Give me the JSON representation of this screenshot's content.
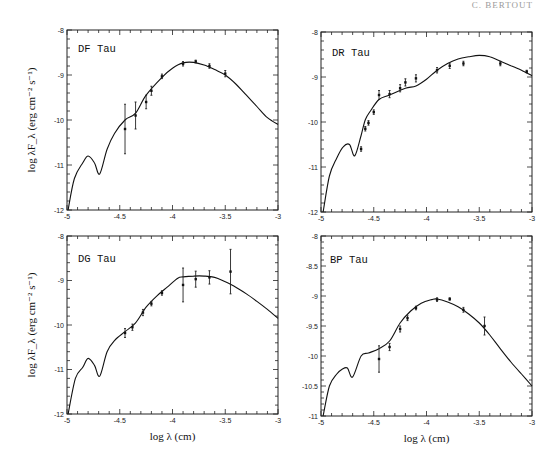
{
  "header": {
    "text": "C. BERTOUT"
  },
  "axis_labels": {
    "y": "log λF_λ (erg cm⁻² s⁻¹)",
    "x": "log λ  (cm)"
  },
  "chart_data": [
    {
      "type": "line",
      "title": "DF Tau",
      "xlabel": "",
      "ylabel": "log λF_λ (erg cm⁻² s⁻¹)",
      "xlim": [
        -5,
        -3
      ],
      "ylim": [
        -12,
        -8
      ],
      "xticks": [
        "-5",
        "-4.5",
        "-4",
        "-3.5",
        "-3"
      ],
      "yticks": [
        "-12",
        "-11",
        "-10",
        "-9",
        "-8"
      ],
      "model_curve": {
        "x": [
          -4.99,
          -4.93,
          -4.85,
          -4.8,
          -4.74,
          -4.69,
          -4.62,
          -4.55,
          -4.45,
          -4.35,
          -4.25,
          -4.1,
          -4.0,
          -3.9,
          -3.8,
          -3.7,
          -3.6,
          -3.5,
          -3.4,
          -3.3,
          -3.2,
          -3.1,
          -3.0
        ],
        "y": [
          -12.0,
          -11.3,
          -10.95,
          -10.8,
          -10.95,
          -11.2,
          -10.65,
          -10.3,
          -10.0,
          -9.85,
          -9.45,
          -9.05,
          -8.85,
          -8.73,
          -8.72,
          -8.78,
          -8.88,
          -9.0,
          -9.2,
          -9.45,
          -9.7,
          -9.95,
          -10.1
        ]
      },
      "observations": [
        {
          "x": -4.45,
          "y": -10.2,
          "err": 0.55
        },
        {
          "x": -4.35,
          "y": -9.9,
          "err": 0.3
        },
        {
          "x": -4.25,
          "y": -9.6,
          "err": 0.15
        },
        {
          "x": -4.2,
          "y": -9.35,
          "err": 0.1
        },
        {
          "x": -4.1,
          "y": -9.03,
          "err": 0.05
        },
        {
          "x": -3.9,
          "y": -8.75,
          "err": 0.05
        },
        {
          "x": -3.78,
          "y": -8.7,
          "err": 0.03
        },
        {
          "x": -3.65,
          "y": -8.8,
          "err": 0.05
        },
        {
          "x": -3.5,
          "y": -8.97,
          "err": 0.07
        }
      ]
    },
    {
      "type": "line",
      "title": "DR Tau",
      "xlabel": "",
      "ylabel": "",
      "xlim": [
        -5,
        -3
      ],
      "ylim": [
        -12,
        -8
      ],
      "xticks": [
        "-5",
        "-4.5",
        "-4",
        "-3.5",
        "-3"
      ],
      "yticks": [
        "-12",
        "-11",
        "-10",
        "-9",
        "-8"
      ],
      "model_curve": {
        "x": [
          -4.98,
          -4.92,
          -4.85,
          -4.79,
          -4.73,
          -4.68,
          -4.62,
          -4.58,
          -4.53,
          -4.45,
          -4.35,
          -4.2,
          -4.1,
          -4.0,
          -3.9,
          -3.8,
          -3.7,
          -3.6,
          -3.5,
          -3.4,
          -3.3,
          -3.2,
          -3.1,
          -3.0
        ],
        "y": [
          -12.0,
          -11.2,
          -10.8,
          -10.55,
          -10.5,
          -10.75,
          -10.3,
          -9.95,
          -9.75,
          -9.5,
          -9.4,
          -9.25,
          -9.2,
          -9.05,
          -8.85,
          -8.7,
          -8.6,
          -8.55,
          -8.52,
          -8.55,
          -8.65,
          -8.75,
          -8.85,
          -8.97
        ]
      },
      "observations": [
        {
          "x": -4.62,
          "y": -10.6,
          "err": 0.05
        },
        {
          "x": -4.58,
          "y": -10.15,
          "err": 0.05
        },
        {
          "x": -4.55,
          "y": -10.02,
          "err": 0.05
        },
        {
          "x": -4.5,
          "y": -9.78,
          "err": 0.05
        },
        {
          "x": -4.45,
          "y": -9.4,
          "err": 0.1
        },
        {
          "x": -4.35,
          "y": -9.38,
          "err": 0.08
        },
        {
          "x": -4.25,
          "y": -9.25,
          "err": 0.08
        },
        {
          "x": -4.2,
          "y": -9.12,
          "err": 0.08
        },
        {
          "x": -4.1,
          "y": -9.03,
          "err": 0.08
        },
        {
          "x": -3.9,
          "y": -8.85,
          "err": 0.06
        },
        {
          "x": -3.78,
          "y": -8.75,
          "err": 0.06
        },
        {
          "x": -3.65,
          "y": -8.7,
          "err": 0.05
        },
        {
          "x": -3.3,
          "y": -8.7,
          "err": 0.05
        },
        {
          "x": -3.05,
          "y": -8.88,
          "err": 0.03
        }
      ]
    },
    {
      "type": "line",
      "title": "DG Tau",
      "xlabel": "log λ  (cm)",
      "ylabel": "log λF_λ (erg cm⁻² s⁻¹)",
      "xlim": [
        -5,
        -3
      ],
      "ylim": [
        -12,
        -8
      ],
      "xticks": [
        "-5",
        "-4.5",
        "-4",
        "-3.5",
        "-3"
      ],
      "yticks": [
        "-12",
        "-11",
        "-10",
        "-9",
        "-8"
      ],
      "model_curve": {
        "x": [
          -4.99,
          -4.92,
          -4.85,
          -4.8,
          -4.74,
          -4.69,
          -4.62,
          -4.55,
          -4.45,
          -4.35,
          -4.25,
          -4.15,
          -4.05,
          -3.95,
          -3.9,
          -3.8,
          -3.7,
          -3.6,
          -3.5,
          -3.4,
          -3.3,
          -3.2,
          -3.1,
          -3.0
        ],
        "y": [
          -12.0,
          -11.2,
          -10.95,
          -10.75,
          -10.9,
          -11.15,
          -10.6,
          -10.35,
          -10.15,
          -9.95,
          -9.6,
          -9.35,
          -9.15,
          -8.95,
          -8.92,
          -8.9,
          -8.9,
          -8.93,
          -9.03,
          -9.15,
          -9.3,
          -9.47,
          -9.65,
          -9.85
        ]
      },
      "observations": [
        {
          "x": -4.45,
          "y": -10.18,
          "err": 0.1
        },
        {
          "x": -4.38,
          "y": -10.05,
          "err": 0.07
        },
        {
          "x": -4.28,
          "y": -9.72,
          "err": 0.07
        },
        {
          "x": -4.2,
          "y": -9.52,
          "err": 0.05
        },
        {
          "x": -4.1,
          "y": -9.28,
          "err": 0.05
        },
        {
          "x": -3.9,
          "y": -9.1,
          "err": 0.38
        },
        {
          "x": -3.78,
          "y": -8.97,
          "err": 0.18
        },
        {
          "x": -3.65,
          "y": -8.93,
          "err": 0.15
        },
        {
          "x": -3.45,
          "y": -8.8,
          "err": 0.5
        }
      ]
    },
    {
      "type": "line",
      "title": "BP Tau",
      "xlabel": "log λ  (cm)",
      "ylabel": "",
      "xlim": [
        -5,
        -3
      ],
      "ylim": [
        -11,
        -8
      ],
      "xticks": [
        "-5",
        "-4.5",
        "-4",
        "-3.5",
        "-3"
      ],
      "yticks": [
        "-11",
        "-10.5",
        "-10",
        "-9.5",
        "-9",
        "-8.5",
        "-8"
      ],
      "model_curve": {
        "x": [
          -4.98,
          -4.92,
          -4.85,
          -4.8,
          -4.75,
          -4.7,
          -4.62,
          -4.55,
          -4.45,
          -4.35,
          -4.25,
          -4.15,
          -4.05,
          -3.95,
          -3.9,
          -3.8,
          -3.7,
          -3.6,
          -3.5,
          -3.4,
          -3.3,
          -3.2,
          -3.1,
          -3.0
        ],
        "y": [
          -11.0,
          -10.5,
          -10.3,
          -10.22,
          -10.2,
          -10.35,
          -10.0,
          -9.95,
          -9.88,
          -9.75,
          -9.45,
          -9.25,
          -9.12,
          -9.06,
          -9.05,
          -9.1,
          -9.18,
          -9.3,
          -9.45,
          -9.65,
          -9.88,
          -10.1,
          -10.3,
          -10.5
        ]
      },
      "observations": [
        {
          "x": -4.45,
          "y": -10.05,
          "err": 0.22
        },
        {
          "x": -4.35,
          "y": -9.85,
          "err": 0.06
        },
        {
          "x": -4.25,
          "y": -9.55,
          "err": 0.05
        },
        {
          "x": -4.18,
          "y": -9.37,
          "err": 0.04
        },
        {
          "x": -4.1,
          "y": -9.2,
          "err": 0.03
        },
        {
          "x": -3.9,
          "y": -9.06,
          "err": 0.03
        },
        {
          "x": -3.78,
          "y": -9.05,
          "err": 0.02
        },
        {
          "x": -3.65,
          "y": -9.23,
          "err": 0.04
        },
        {
          "x": -3.45,
          "y": -9.5,
          "err": 0.15
        }
      ]
    }
  ],
  "layout": {
    "panels": [
      {
        "left": 67,
        "top": 30,
        "right": 278,
        "bottom": 210,
        "label_x": 78,
        "label_y": 52,
        "show_ylabel": true,
        "show_xlabel": false,
        "minor_y": 0.2
      },
      {
        "left": 321,
        "top": 32,
        "right": 532,
        "bottom": 212,
        "label_x": 332,
        "label_y": 56,
        "show_ylabel": false,
        "show_xlabel": false,
        "minor_y": 0.2
      },
      {
        "left": 67,
        "top": 236,
        "right": 278,
        "bottom": 414,
        "label_x": 78,
        "label_y": 262,
        "show_ylabel": true,
        "show_xlabel": true,
        "minor_y": 0.2
      },
      {
        "left": 321,
        "top": 236,
        "right": 532,
        "bottom": 416,
        "label_x": 330,
        "label_y": 263,
        "show_ylabel": false,
        "show_xlabel": true,
        "minor_y": 0.1
      }
    ]
  }
}
